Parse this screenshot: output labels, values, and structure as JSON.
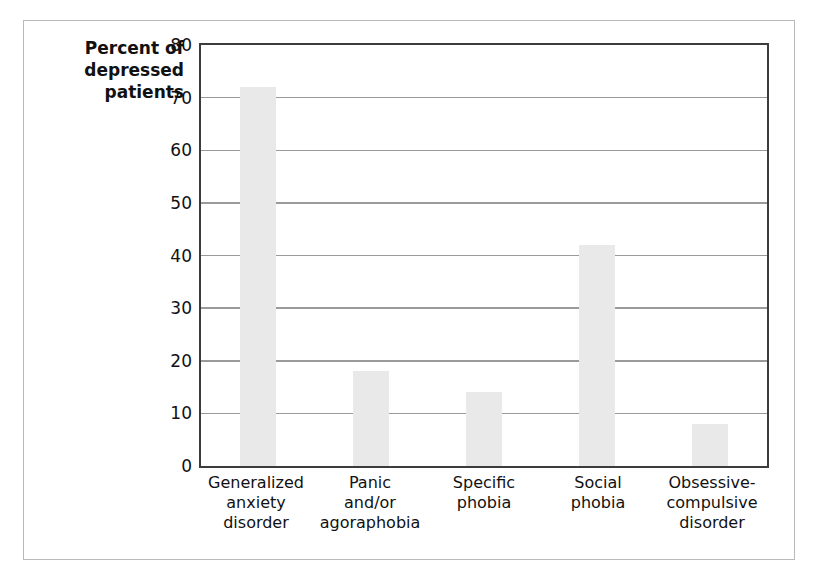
{
  "chart_data": {
    "type": "bar",
    "title": "",
    "xlabel": "",
    "ylabel": "Percent of\ndepressed\npatients",
    "ylim": [
      0,
      80
    ],
    "yticks": [
      "0",
      "10",
      "20",
      "30",
      "40",
      "50",
      "60",
      "70",
      "80"
    ],
    "ytick_values": [
      0,
      10,
      20,
      30,
      40,
      50,
      60,
      70,
      80
    ],
    "grid": true,
    "legend": "none",
    "bar_color": "#e9e9e9",
    "axis_color": "#3c3c3c",
    "gridline_color": "#9a9a9a",
    "categories": [
      "Generalized\nanxiety\ndisorder",
      "Panic\nand/or\nagoraphobia",
      "Specific\nphobia",
      "Social\nphobia",
      "Obsessive-\ncompulsive\ndisorder"
    ],
    "values": [
      72,
      18,
      14,
      42,
      8
    ]
  }
}
